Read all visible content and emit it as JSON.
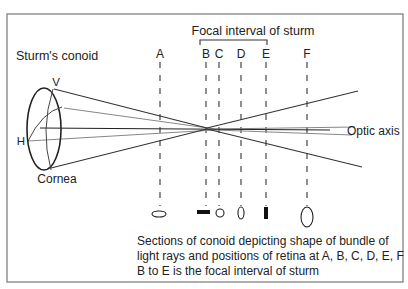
{
  "figure": {
    "title": "Focal interval of sturm",
    "conoid_label": "Sturm's conoid",
    "vertical_meridian_label": "V",
    "horizontal_meridian_label": "H",
    "cornea_label": "Cornea",
    "optic_axis_label": "Optic axis",
    "positions": [
      {
        "label": "A",
        "section_shape": "horizontal ellipse"
      },
      {
        "label": "B",
        "section_shape": "horizontal line"
      },
      {
        "label": "C",
        "section_shape": "circle (circle of least confusion)"
      },
      {
        "label": "D",
        "section_shape": "vertical ellipse"
      },
      {
        "label": "E",
        "section_shape": "vertical line"
      },
      {
        "label": "F",
        "section_shape": "vertical ellipse (large)"
      }
    ],
    "caption_lines": [
      "Sections of conoid depicting shape of bundle of",
      "light rays and positions of retina at A, B, C, D, E, F",
      "B to E is the focal interval of sturm"
    ]
  }
}
